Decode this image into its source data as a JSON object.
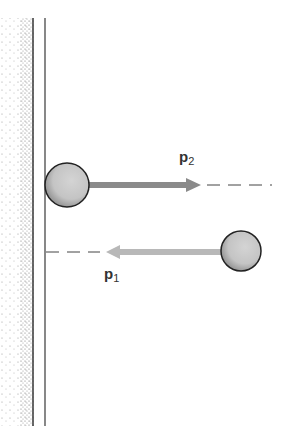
{
  "diagram": {
    "title": "",
    "wall": {
      "description": "fixed wall with stippled shading",
      "x_face": 45
    },
    "balls": [
      {
        "id": "ball-after",
        "description": "ball moving away from wall (after collision)",
        "cx": 67,
        "cy": 185,
        "r": 22
      },
      {
        "id": "ball-before",
        "description": "ball moving toward wall (before collision)",
        "cx": 241,
        "cy": 251,
        "r": 20
      }
    ],
    "arrows": [
      {
        "id": "p2",
        "label_main": "p",
        "label_sub": "2",
        "direction": "right",
        "color": "#8a8a8a"
      },
      {
        "id": "p1",
        "label_main": "p",
        "label_sub": "1",
        "direction": "left",
        "color": "#b5b5b5"
      }
    ],
    "colors": {
      "wall_line": "#555555",
      "ball_fill": "#c9c9c9",
      "ball_stroke": "#222222",
      "arrow_p2": "#8a8a8a",
      "arrow_p1": "#b8b8b8",
      "dash": "#444444"
    }
  }
}
